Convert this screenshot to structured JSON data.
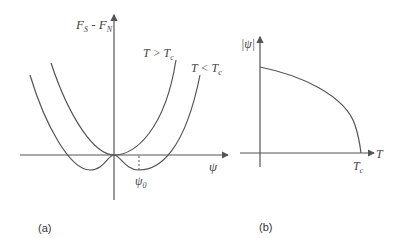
{
  "panel_a": {
    "y_axis_label_main": "F",
    "y_axis_label_sub1": "S",
    "y_axis_label_mid": " - F",
    "y_axis_label_sub2": "N",
    "x_axis_label": "ψ",
    "curve_high_label_main": "T > T",
    "curve_high_label_sub": "c",
    "curve_low_label_main": "T < T",
    "curve_low_label_sub": "c",
    "minimum_label_main": "ψ",
    "minimum_label_sub": "0",
    "caption": "(a)"
  },
  "panel_b": {
    "y_axis_label": "|ψ|",
    "x_axis_label": "T",
    "tc_label_main": "T",
    "tc_label_sub": "c",
    "caption": "(b)"
  },
  "colors": {
    "line": "#555555",
    "text": "#444444"
  }
}
